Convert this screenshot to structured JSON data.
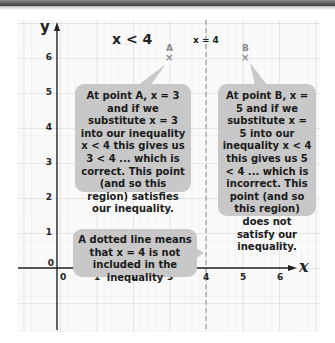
{
  "axes": {
    "x_label": "x",
    "y_label": "y",
    "x_ticks": [
      "0",
      "1",
      "2",
      "3",
      "4",
      "5",
      "6"
    ],
    "y_ticks": [
      "0",
      "1",
      "2",
      "3",
      "4",
      "5",
      "6"
    ]
  },
  "region_label": "x < 4",
  "boundary_label": "x = 4",
  "points": [
    {
      "name": "A",
      "x": 3,
      "y": 6,
      "marker": "×"
    },
    {
      "name": "B",
      "x": 5,
      "y": 6,
      "marker": "×"
    }
  ],
  "callouts": {
    "point_a": "At point A, x = 3 and if we substitute x = 3 into our inequality x < 4 this gives us 3 < 4 ... which is correct. This point (and so this region) satisfies our inequality.",
    "point_b": "At point B, x = 5 and if we substitute x = 5 into our inequality x < 4 this gives us 5 < 4 ... which is incorrect. This point (and so this region) does not satisfy our inequality.",
    "dotted_line": "A dotted line means that x = 4 is not included in the inequality"
  },
  "colors": {
    "callout_bg": "#c8c8c8",
    "grid_minor": "#e4e4e4",
    "grid_major": "#cfcfcf",
    "axis": "#222222",
    "dashed_line": "#9a9a9a",
    "point_marker": "#8a8a8a"
  }
}
